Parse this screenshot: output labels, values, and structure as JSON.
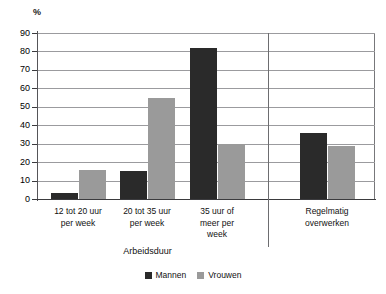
{
  "chart_data": {
    "type": "bar",
    "title": "",
    "subtitle": "",
    "unit_label": "%",
    "xlabel": "Arbeidsduur",
    "ylabel": "%",
    "ylim": [
      0,
      90
    ],
    "ytick_step": 10,
    "yticks": [
      0,
      10,
      20,
      30,
      40,
      50,
      60,
      70,
      80,
      90
    ],
    "ytick_labels": [
      "0",
      "10",
      "20",
      "30",
      "40",
      "50",
      "60",
      "70",
      "80",
      "90"
    ],
    "grid": true,
    "grid_axis": "y",
    "legend_position": "bottom-center",
    "categories": [
      "12 tot 20 uur per week",
      "20 tot 35 uur per week",
      "35 uur of meer per week",
      "Regelmatig overwerken"
    ],
    "category_label_lines": [
      [
        "12 tot 20 uur",
        "per week"
      ],
      [
        "20 tot 35 uur",
        "per week"
      ],
      [
        "35 uur of",
        "meer per",
        "week"
      ],
      [
        "Regelmatig",
        "overwerken"
      ]
    ],
    "series": [
      {
        "name": "Mannen",
        "color": "#2a2a2a",
        "values": [
          3,
          15,
          82,
          36
        ]
      },
      {
        "name": "Vrouwen",
        "color": "#9a9a9a",
        "values": [
          16,
          55,
          30,
          29
        ]
      }
    ],
    "group_separator_after_category_index": 2
  },
  "legend": {
    "items": [
      {
        "label": "Mannen",
        "color": "#2a2a2a"
      },
      {
        "label": "Vrouwen",
        "color": "#9a9a9a"
      }
    ]
  },
  "axis": {
    "group_title": "Arbeidsduur",
    "unit": "%"
  },
  "colors": {
    "men": "#2a2a2a",
    "women": "#9a9a9a",
    "gridline": "#9b9b9e",
    "axis": "#3b3b3e",
    "background": "#ffffff"
  }
}
